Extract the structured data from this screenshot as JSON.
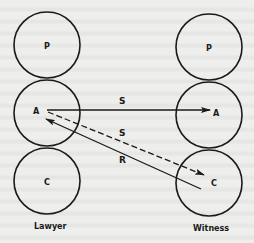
{
  "diagram": {
    "type": "communication-model",
    "columns": [
      {
        "id": "lawyer",
        "label": "Lawyer",
        "cx": 47,
        "label_y": 229,
        "nodes": [
          {
            "id": "P",
            "label": "P",
            "cy": 45
          },
          {
            "id": "A",
            "label": "A",
            "cy": 113
          },
          {
            "id": "C",
            "label": "C",
            "cy": 181
          }
        ]
      },
      {
        "id": "witness",
        "label": "Witness",
        "cx": 209,
        "label_y": 231,
        "nodes": [
          {
            "id": "P",
            "label": "P",
            "cy": 47
          },
          {
            "id": "A",
            "label": "A",
            "cy": 115
          },
          {
            "id": "C",
            "label": "C",
            "cy": 183
          }
        ]
      }
    ],
    "node_radius": 33,
    "edges": [
      {
        "from": "lawyer.A",
        "to": "witness.A",
        "label": "S",
        "style": "solid",
        "arrow": "end"
      },
      {
        "from": "lawyer.A",
        "to": "witness.C",
        "label": "S",
        "style": "dashed",
        "arrow": "end"
      },
      {
        "from": "witness.C",
        "to": "lawyer.A",
        "label": "R",
        "style": "solid",
        "arrow": "end"
      }
    ],
    "colors": {
      "ink": "#1a1a1a",
      "paper": "#eeeeec"
    }
  }
}
